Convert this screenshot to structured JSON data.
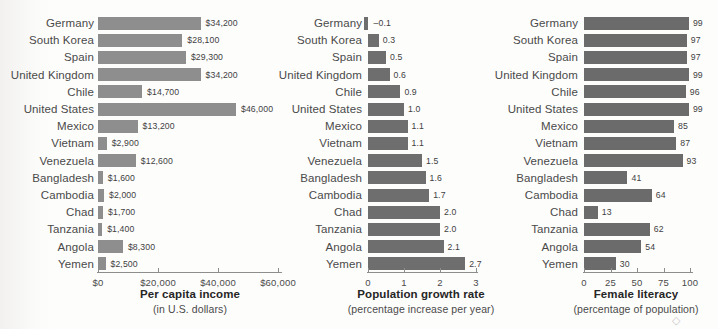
{
  "figure": {
    "background": "#fdfdfc",
    "bar_color_income": "#8e8e8e",
    "bar_color_growth": "#6e6e6e",
    "bar_color_literacy": "#6b6b6b",
    "axis_color": "#8d8d8d",
    "corner_mark": "◇"
  },
  "categories": [
    "Germany",
    "South Korea",
    "Spain",
    "United Kingdom",
    "Chile",
    "United States",
    "Mexico",
    "Vietnam",
    "Venezuela",
    "Bangladesh",
    "Cambodia",
    "Chad",
    "Tanzania",
    "Angola",
    "Yemen"
  ],
  "chart_data": [
    {
      "type": "bar",
      "orientation": "horizontal",
      "title": "Per capita income",
      "subtitle": "(in U.S. dollars)",
      "xlabel": "Per capita income",
      "ylabel": "",
      "xlim": [
        0,
        60000
      ],
      "xticks": [
        0,
        20000,
        40000,
        60000
      ],
      "xticklabels": [
        "$0",
        "$20,000",
        "$40,000",
        "$60,000"
      ],
      "grid": false,
      "legend": "none",
      "categories": [
        "Germany",
        "South Korea",
        "Spain",
        "United Kingdom",
        "Chile",
        "United States",
        "Mexico",
        "Vietnam",
        "Venezuela",
        "Bangladesh",
        "Cambodia",
        "Chad",
        "Tanzania",
        "Angola",
        "Yemen"
      ],
      "values": [
        34200,
        28100,
        29300,
        34200,
        14700,
        46000,
        13200,
        2900,
        12600,
        1600,
        2000,
        1700,
        1400,
        8300,
        2500
      ],
      "value_labels": [
        "$34,200",
        "$28,100",
        "$29,300",
        "$34,200",
        "$14,700",
        "$46,000",
        "$13,200",
        "$2,900",
        "$12,600",
        "$1,600",
        "$2,000",
        "$1,700",
        "$1,400",
        "$8,300",
        "$2,500"
      ]
    },
    {
      "type": "bar",
      "orientation": "horizontal",
      "title": "Population growth rate",
      "subtitle": "(percentage increase per year)",
      "xlabel": "Population growth rate",
      "ylabel": "",
      "xlim": [
        0,
        3
      ],
      "xticks": [
        0,
        1,
        2,
        3
      ],
      "xticklabels": [
        "0",
        "1",
        "2",
        "3"
      ],
      "grid": false,
      "legend": "none",
      "categories": [
        "Germany",
        "South Korea",
        "Spain",
        "United Kingdom",
        "Chile",
        "United States",
        "Mexico",
        "Vietnam",
        "Venezuela",
        "Bangladesh",
        "Cambodia",
        "Chad",
        "Tanzania",
        "Angola",
        "Yemen"
      ],
      "values": [
        -0.1,
        0.3,
        0.5,
        0.6,
        0.9,
        1.0,
        1.1,
        1.1,
        1.5,
        1.6,
        1.7,
        2.0,
        2.0,
        2.1,
        2.7
      ],
      "value_labels": [
        "–0.1",
        "0.3",
        "0.5",
        "0.6",
        "0.9",
        "1.0",
        "1.1",
        "1.1",
        "1.5",
        "1.6",
        "1.7",
        "2.0",
        "2.0",
        "2.1",
        "2.7"
      ]
    },
    {
      "type": "bar",
      "orientation": "horizontal",
      "title": "Female literacy",
      "subtitle": "(percentage of population)",
      "xlabel": "Female literacy",
      "ylabel": "",
      "xlim": [
        0,
        100
      ],
      "xticks": [
        0,
        25,
        50,
        75,
        100
      ],
      "xticklabels": [
        "0",
        "25",
        "50",
        "75",
        "100"
      ],
      "grid": false,
      "legend": "none",
      "categories": [
        "Germany",
        "South Korea",
        "Spain",
        "United Kingdom",
        "Chile",
        "United States",
        "Mexico",
        "Vietnam",
        "Venezuela",
        "Bangladesh",
        "Cambodia",
        "Chad",
        "Tanzania",
        "Angola",
        "Yemen"
      ],
      "values": [
        99,
        97,
        97,
        99,
        96,
        99,
        85,
        87,
        93,
        41,
        64,
        13,
        62,
        54,
        30
      ],
      "value_labels": [
        "99",
        "97",
        "97",
        "99",
        "96",
        "99",
        "85",
        "87",
        "93",
        "41",
        "64",
        "13",
        "62",
        "54",
        "30"
      ]
    }
  ]
}
